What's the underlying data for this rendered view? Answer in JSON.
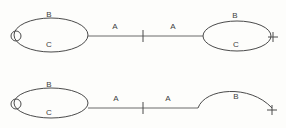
{
  "diagram": {
    "background_color": "#fdfdfb",
    "stroke_color": "#4a4a4a",
    "label_color": "#3d3d3d",
    "rows": [
      {
        "id": "row-top",
        "left_shape": {
          "type": "closed-ellipse",
          "cx": 51,
          "cy": 35,
          "rx": 37,
          "ry": 17,
          "end_marker": {
            "type": "open-circle",
            "cx": 16,
            "cy": 36,
            "r": 5
          },
          "labels": [
            {
              "text": "B",
              "x": 49,
              "y": 15
            },
            {
              "text": "C",
              "x": 49,
              "y": 45
            }
          ]
        },
        "connector": {
          "x1": 88,
          "x2": 203,
          "y": 36,
          "tick": {
            "x": 143,
            "y1": 30,
            "y2": 42
          },
          "labels": [
            {
              "text": "A",
              "x": 115,
              "y": 27
            },
            {
              "text": "A",
              "x": 173,
              "y": 27
            }
          ]
        },
        "right_shape": {
          "type": "closed-ellipse",
          "cx": 237,
          "cy": 36,
          "rx": 34,
          "ry": 15,
          "end_marker": {
            "type": "plus",
            "x": 273,
            "y": 37,
            "size": 5
          },
          "labels": [
            {
              "text": "B",
              "x": 235,
              "y": 16
            },
            {
              "text": "C",
              "x": 236,
              "y": 45
            }
          ]
        }
      },
      {
        "id": "row-bottom",
        "left_shape": {
          "type": "closed-ellipse",
          "cx": 51,
          "cy": 103,
          "rx": 37,
          "ry": 15,
          "end_marker": {
            "type": "open-circle",
            "cx": 16,
            "cy": 104,
            "r": 5
          },
          "labels": [
            {
              "text": "B",
              "x": 49,
              "y": 85
            },
            {
              "text": "C",
              "x": 49,
              "y": 113
            }
          ]
        },
        "connector": {
          "x1": 88,
          "x2": 198,
          "y": 108,
          "tick": {
            "x": 143,
            "y1": 102,
            "y2": 114
          },
          "labels": [
            {
              "text": "A",
              "x": 116,
              "y": 99
            },
            {
              "text": "A",
              "x": 168,
              "y": 99
            }
          ]
        },
        "right_shape": {
          "type": "open-arc",
          "path": "M 198 108 C 205 88 250 84 272 108",
          "end_marker": {
            "type": "plus",
            "x": 272,
            "y": 110,
            "size": 5
          },
          "labels": [
            {
              "text": "B",
              "x": 236,
              "y": 97
            }
          ]
        }
      }
    ]
  }
}
